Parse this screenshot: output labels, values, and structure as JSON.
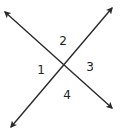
{
  "diagram": {
    "line_color": "#2a2a2a",
    "label_color": "#222222",
    "lines": [
      {
        "name": "line-a",
        "x1": 5,
        "y1": 12,
        "x2": 112,
        "y2": 108
      },
      {
        "name": "line-b",
        "x1": 112,
        "y1": 8,
        "x2": 11,
        "y2": 127
      }
    ],
    "labels": [
      {
        "text": "1",
        "x": 41,
        "y": 70
      },
      {
        "text": "2",
        "x": 63,
        "y": 41
      },
      {
        "text": "3",
        "x": 90,
        "y": 67
      },
      {
        "text": "4",
        "x": 67,
        "y": 95
      }
    ]
  }
}
